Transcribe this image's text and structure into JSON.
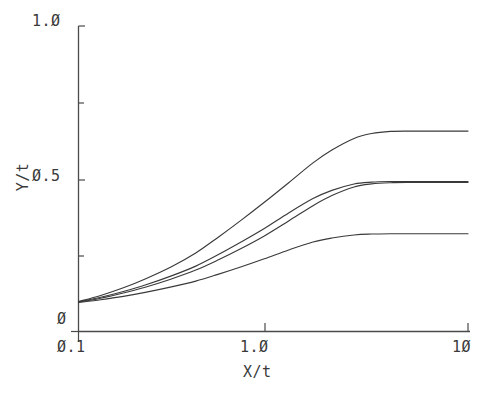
{
  "chart_data": {
    "type": "line",
    "title": "",
    "xlabel": "X/t",
    "ylabel": "Y/t",
    "xscale": "log",
    "yscale": "linear",
    "xlim": [
      0.1,
      10
    ],
    "ylim": [
      0,
      1.0
    ],
    "grid": false,
    "legend": null,
    "xticks": [
      {
        "value": 0.1,
        "label": "Ø.1"
      },
      {
        "value": 1.0,
        "label": "1.Ø"
      },
      {
        "value": 10,
        "label": "1Ø"
      }
    ],
    "yticks": [
      {
        "value": 0,
        "label": "Ø"
      },
      {
        "value": 0.5,
        "label": "Ø.5"
      },
      {
        "value": 1.0,
        "label": "1.Ø"
      }
    ],
    "yticks_minor": [
      0.25,
      0.75
    ],
    "line_color": "#3a3a3a",
    "series": [
      {
        "name": "curve-1",
        "plateau": 0.655,
        "x": [
          0.1,
          0.13,
          0.17,
          0.22,
          0.3,
          0.4,
          0.52,
          0.68,
          0.9,
          1.2,
          1.6,
          2.0,
          2.6,
          3.2,
          4.0,
          5.0,
          6.5,
          8.0,
          10.0
        ],
        "y": [
          0.098,
          0.118,
          0.143,
          0.172,
          0.212,
          0.257,
          0.308,
          0.363,
          0.423,
          0.487,
          0.552,
          0.594,
          0.632,
          0.648,
          0.655,
          0.656,
          0.656,
          0.656,
          0.656
        ]
      },
      {
        "name": "curve-2",
        "plateau": 0.49,
        "x": [
          0.1,
          0.13,
          0.17,
          0.22,
          0.3,
          0.4,
          0.52,
          0.68,
          0.9,
          1.2,
          1.6,
          2.0,
          2.6,
          3.2,
          4.0,
          5.0,
          6.5,
          8.0,
          10.0
        ],
        "y": [
          0.097,
          0.112,
          0.131,
          0.152,
          0.182,
          0.214,
          0.251,
          0.292,
          0.337,
          0.388,
          0.435,
          0.462,
          0.483,
          0.489,
          0.491,
          0.491,
          0.491,
          0.491,
          0.491
        ]
      },
      {
        "name": "curve-3",
        "plateau": 0.485,
        "x": [
          0.1,
          0.13,
          0.17,
          0.22,
          0.3,
          0.4,
          0.52,
          0.68,
          0.9,
          1.2,
          1.6,
          2.0,
          2.6,
          3.2,
          4.0,
          5.0,
          6.5,
          8.0,
          10.0
        ],
        "y": [
          0.096,
          0.109,
          0.126,
          0.145,
          0.172,
          0.201,
          0.234,
          0.271,
          0.313,
          0.362,
          0.412,
          0.445,
          0.473,
          0.483,
          0.487,
          0.488,
          0.488,
          0.488,
          0.488
        ]
      },
      {
        "name": "curve-4",
        "plateau": 0.32,
        "x": [
          0.1,
          0.13,
          0.17,
          0.22,
          0.3,
          0.4,
          0.52,
          0.68,
          0.9,
          1.2,
          1.6,
          2.0,
          2.6,
          3.2,
          4.0,
          5.0,
          6.5,
          8.0,
          10.0
        ],
        "y": [
          0.095,
          0.104,
          0.115,
          0.128,
          0.146,
          0.165,
          0.187,
          0.211,
          0.238,
          0.267,
          0.293,
          0.306,
          0.316,
          0.319,
          0.32,
          0.32,
          0.32,
          0.32,
          0.32
        ]
      }
    ]
  },
  "axes": {
    "y_top_label": "1.Ø",
    "y_mid_label": "Ø.5",
    "y_zero_label": "Ø",
    "x_start_label": "Ø.1",
    "x_mid_label": "1.Ø",
    "x_end_label": "1Ø",
    "x_title": "X/t",
    "y_title": "Y/t"
  }
}
